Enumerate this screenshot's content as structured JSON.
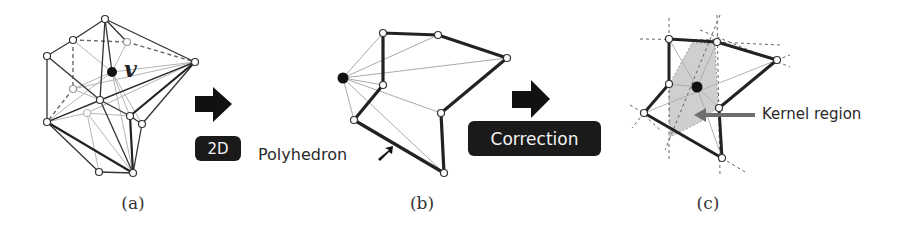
{
  "figure": {
    "panels": [
      {
        "id": "a",
        "caption": "(a)",
        "description": "3D polyhedron around vertex v"
      },
      {
        "id": "b",
        "caption": "(b)",
        "description": "Projected 2D polygon"
      },
      {
        "id": "c",
        "caption": "(c)",
        "description": "Corrected polygon with kernel region"
      }
    ],
    "vertex_label": "v",
    "step1": {
      "label": "2D"
    },
    "step2": {
      "label": "Correction"
    },
    "annotations": {
      "polyhedron": "Polyhedron",
      "kernel_region": "Kernel region"
    },
    "colors": {
      "edge": "#2b2b2b",
      "thin_edge": "#9a9a9a",
      "dashed_edge": "#666666",
      "kernel_fill": "#cfcfcf",
      "kernel_arrow": "#6e6e6e",
      "tag_bg": "#1a1a1a",
      "tag_text": "#f2f2f2"
    }
  }
}
